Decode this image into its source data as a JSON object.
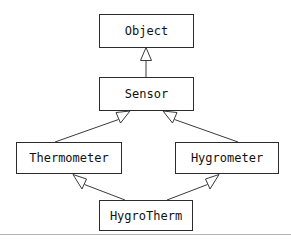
{
  "diagram": {
    "type": "uml-class-diagram",
    "canvas": {
      "width": 291,
      "height": 241
    },
    "colors": {
      "background": "#ffffff",
      "box_fill": "#ffffff",
      "box_stroke": "#2b2b2b",
      "edge_stroke": "#3a3a3a",
      "arrowhead_fill": "#ffffff",
      "text": "#111111",
      "footer_rule": "#b4b4b4"
    },
    "nodes": [
      {
        "id": "object",
        "label": "Object",
        "x": 99,
        "y": 14,
        "width": 95,
        "height": 34
      },
      {
        "id": "sensor",
        "label": "Sensor",
        "x": 99,
        "y": 77,
        "width": 95,
        "height": 34
      },
      {
        "id": "thermometer",
        "label": "Thermometer",
        "x": 16,
        "y": 142,
        "width": 106,
        "height": 32
      },
      {
        "id": "hygrometer",
        "label": "Hygrometer",
        "x": 175,
        "y": 142,
        "width": 104,
        "height": 32
      },
      {
        "id": "hygrotherm",
        "label": "HygroTherm",
        "x": 99,
        "y": 200,
        "width": 94,
        "height": 31
      }
    ],
    "edges": [
      {
        "id": "sensor-to-object",
        "from": "sensor",
        "to": "object",
        "relation": "generalization",
        "arrowhead": "hollow-triangle"
      },
      {
        "id": "thermometer-to-sensor",
        "from": "thermometer",
        "to": "sensor",
        "relation": "generalization",
        "arrowhead": "hollow-triangle"
      },
      {
        "id": "hygrometer-to-sensor",
        "from": "hygrometer",
        "to": "sensor",
        "relation": "generalization",
        "arrowhead": "hollow-triangle"
      },
      {
        "id": "hygrotherm-to-thermometer",
        "from": "hygrotherm",
        "to": "thermometer",
        "relation": "generalization",
        "arrowhead": "hollow-triangle"
      },
      {
        "id": "hygrotherm-to-hygrometer",
        "from": "hygrotherm",
        "to": "hygrometer",
        "relation": "generalization",
        "arrowhead": "hollow-triangle"
      }
    ],
    "footer_rule_visible": true
  }
}
